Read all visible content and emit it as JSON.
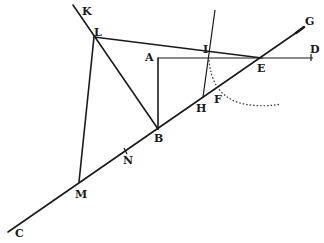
{
  "diagram": {
    "type": "geometric-construction",
    "points": {
      "K": {
        "label": "K",
        "x": 73,
        "y": 5,
        "lx": 82,
        "ly": 15
      },
      "L": {
        "label": "L",
        "x": 94,
        "y": 37,
        "lx": 94,
        "ly": 36
      },
      "A": {
        "label": "A",
        "x": 158,
        "y": 58,
        "lx": 145,
        "ly": 61
      },
      "I": {
        "label": "I",
        "x": 209,
        "y": 57,
        "lx": 203,
        "ly": 53
      },
      "E": {
        "label": "E",
        "x": 260,
        "y": 58,
        "lx": 258,
        "ly": 72
      },
      "D": {
        "label": "D",
        "x": 311,
        "y": 57,
        "lx": 311,
        "ly": 53
      },
      "G": {
        "label": "G",
        "x": 303,
        "y": 28,
        "lx": 305,
        "ly": 25
      },
      "H": {
        "label": "H",
        "x": 203,
        "y": 97,
        "lx": 197,
        "ly": 112
      },
      "F": {
        "label": "F",
        "x": 218,
        "y": 87,
        "lx": 214,
        "ly": 103
      },
      "B": {
        "label": "B",
        "x": 158,
        "y": 129,
        "lx": 155,
        "ly": 142
      },
      "N": {
        "label": "N",
        "x": 126,
        "y": 151,
        "lx": 124,
        "ly": 163
      },
      "M": {
        "label": "M",
        "x": 79,
        "y": 182,
        "lx": 76,
        "ly": 197
      },
      "C": {
        "label": "C",
        "x": 8,
        "y": 232,
        "lx": 15,
        "ly": 237
      }
    },
    "labels": [
      "K",
      "L",
      "A",
      "I",
      "E",
      "D",
      "G",
      "H",
      "F",
      "B",
      "N",
      "M",
      "C"
    ],
    "segments": [
      [
        "K",
        "B"
      ],
      [
        "L",
        "E"
      ],
      [
        "L",
        "M"
      ],
      [
        "A",
        "D"
      ],
      [
        "A",
        "B"
      ],
      [
        "C",
        "G"
      ],
      [
        "I",
        "H"
      ]
    ],
    "arc": {
      "style": "dotted",
      "from": "I",
      "through": "F",
      "to_x": 280,
      "to_y": 104
    },
    "colors": {
      "ink": "#1a1a1a",
      "background": "#ffffff"
    }
  }
}
